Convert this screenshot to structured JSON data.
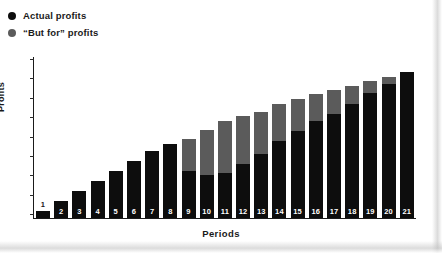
{
  "legend": {
    "items": [
      {
        "label": "Actual profits",
        "marker": "filled-circle",
        "color": "#0d0d0d"
      },
      {
        "label": "“But for” profits",
        "marker": "filled-circle",
        "color": "#5b5b5b"
      }
    ]
  },
  "axes": {
    "y_title": "Profits",
    "x_title": "Periods",
    "y_tick_count": 9,
    "y_tick_labels": [],
    "x_tick_labels": [
      "1",
      "2",
      "3",
      "4",
      "5",
      "6",
      "7",
      "8",
      "9",
      "10",
      "11",
      "12",
      "13",
      "14",
      "15",
      "16",
      "17",
      "18",
      "19",
      "20",
      "21"
    ]
  },
  "colors": {
    "actual": "#0d0d0d",
    "but_for": "#5b5b5b",
    "axis": "#1a1a1a",
    "background": "#ffffff"
  },
  "chart_data": {
    "type": "bar",
    "stacked": true,
    "title": "",
    "subtitle": "",
    "xlabel": "Periods",
    "ylabel": "Profits",
    "categories": [
      "1",
      "2",
      "3",
      "4",
      "5",
      "6",
      "7",
      "8",
      "9",
      "10",
      "11",
      "12",
      "13",
      "14",
      "15",
      "16",
      "17",
      "18",
      "19",
      "20",
      "21"
    ],
    "series": [
      {
        "name": "Actual profits",
        "color": "#0d0d0d",
        "values": [
          6,
          14,
          22,
          30,
          38,
          46,
          54,
          60,
          38,
          35,
          36,
          44,
          52,
          62,
          70,
          78,
          84,
          92,
          101,
          108,
          118
        ]
      },
      {
        "name": "“But for” profits",
        "color": "#5b5b5b",
        "values": [
          0,
          0,
          0,
          0,
          0,
          0,
          0,
          0,
          26,
          36,
          42,
          38,
          34,
          30,
          26,
          22,
          19,
          15,
          10,
          6,
          0
        ]
      }
    ],
    "totals": [
      6,
      14,
      22,
      30,
      38,
      46,
      54,
      60,
      64,
      71,
      78,
      82,
      86,
      92,
      96,
      100,
      103,
      107,
      111,
      114,
      118
    ],
    "ylim": [
      0,
      130
    ],
    "grid": false,
    "legend_position": "top-left",
    "annotations": []
  }
}
